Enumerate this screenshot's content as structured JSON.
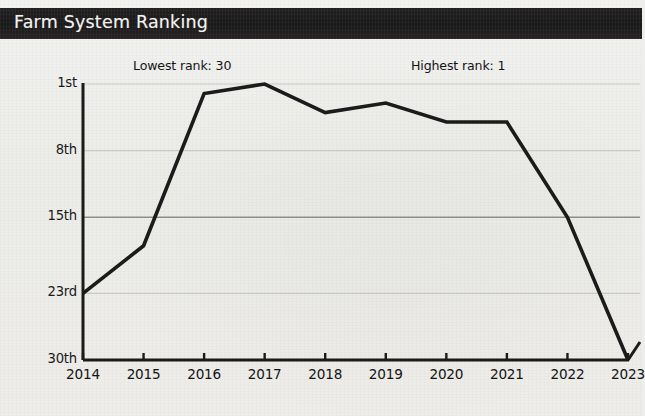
{
  "banner": {
    "title": "Farm System Ranking",
    "background_color": "#1e1d1d",
    "text_color": "#f3f2ef"
  },
  "annotations": {
    "lowest": "Lowest rank: 30",
    "highest": "Highest rank: 1"
  },
  "axes": {
    "y_tick_labels": [
      "1st",
      "8th",
      "15th",
      "23rd",
      "30th"
    ],
    "y_tick_values": [
      1,
      8,
      15,
      23,
      30
    ],
    "x_tick_labels": [
      "2014",
      "2015",
      "2016",
      "2017",
      "2018",
      "2019",
      "2020",
      "2021",
      "2022",
      "2023"
    ]
  },
  "style": {
    "line_color": "#1b1b1b",
    "axis_color": "#1b1b1b",
    "grid_color": "#c9c9c6",
    "grid_emphasis_color": "#8d8d8a",
    "background_color": "#eeedea"
  },
  "chart_data": {
    "type": "line",
    "title": "Farm System Ranking",
    "xlabel": "",
    "ylabel": "",
    "x": [
      2014,
      2015,
      2016,
      2017,
      2018,
      2019,
      2020,
      2021,
      2022,
      2023
    ],
    "categories": [
      "2014",
      "2015",
      "2016",
      "2017",
      "2018",
      "2019",
      "2020",
      "2021",
      "2022",
      "2023"
    ],
    "values": [
      23,
      18,
      2,
      1,
      4,
      3,
      5,
      5,
      15,
      30
    ],
    "series": [
      {
        "name": "Farm System Ranking",
        "values": [
          23,
          18,
          2,
          1,
          4,
          3,
          5,
          5,
          15,
          30
        ]
      }
    ],
    "ylim": [
      1,
      30
    ],
    "y_inverted": true,
    "xlim": [
      2014,
      2023
    ],
    "yticks": [
      1,
      8,
      15,
      23,
      30
    ],
    "ytick_labels": [
      "1st",
      "8th",
      "15th",
      "23rd",
      "30th"
    ],
    "grid": true,
    "legend": false,
    "annotations": [
      "Lowest rank: 30",
      "Highest rank: 1"
    ]
  }
}
